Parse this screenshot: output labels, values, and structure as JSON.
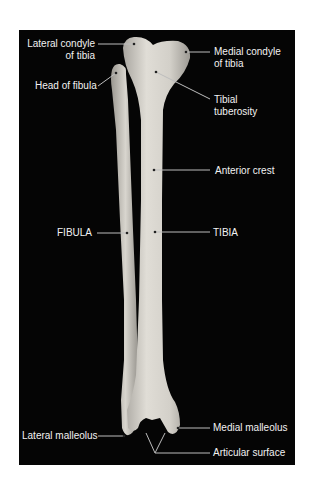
{
  "figure": {
    "background": "#050505",
    "bone_color": "#d6d3cb",
    "label_color": "#f2f2f2",
    "leader_color": "#bdbdbd"
  },
  "labels": {
    "lateral_condyle": [
      "Lateral condyle",
      "of tibia"
    ],
    "medial_condyle": [
      "Medial condyle",
      "of tibia"
    ],
    "head_of_fibula": "Head of fibula",
    "tibial_tuberosity": [
      "Tibial",
      "tuberosity"
    ],
    "anterior_crest": "Anterior crest",
    "fibula": "FIBULA",
    "tibia": "TIBIA",
    "lateral_malleolus": "Lateral malleolus",
    "medial_malleolus": "Medial malleolus",
    "articular_surface": "Articular surface"
  }
}
